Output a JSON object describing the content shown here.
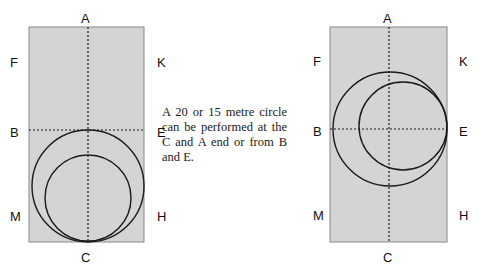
{
  "diagram": {
    "left_arena": {
      "letters": {
        "top": "A",
        "bottom": "C",
        "left_upper": "F",
        "right_upper": "K",
        "left_middle": "B",
        "right_middle": "E",
        "left_lower": "M",
        "right_lower": "H"
      },
      "circles": [
        {
          "label": "20 metre circle at C end",
          "cx": 88,
          "cy": 186,
          "r": 56
        },
        {
          "label": "15 metre circle at C end",
          "cx": 88,
          "cy": 198,
          "r": 43
        }
      ]
    },
    "right_arena": {
      "letters": {
        "top": "A",
        "bottom": "C",
        "left_upper": "F",
        "right_upper": "K",
        "left_middle": "B",
        "right_middle": "E",
        "left_lower": "M",
        "right_lower": "H"
      },
      "circles": [
        {
          "label": "20 metre circle from B",
          "cx": 390,
          "cy": 129,
          "r": 57
        },
        {
          "label": "15 metre circle from E",
          "cx": 403,
          "cy": 126,
          "r": 44
        }
      ]
    },
    "description": "A 20 or 15 metre circle can be performed at the C and A end or from B and E.",
    "colors": {
      "arena_fill": "#d4d4d4",
      "stroke": "#1a1a1a",
      "background": "#ffffff"
    }
  }
}
